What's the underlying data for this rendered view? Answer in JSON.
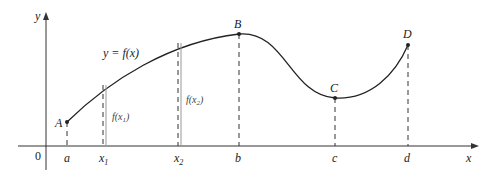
{
  "diagram": {
    "axes": {
      "x_label": "x",
      "y_label": "y",
      "origin_label": "0"
    },
    "curve_label": "y = f(x)",
    "points": [
      {
        "name": "A",
        "x_label": "a"
      },
      {
        "name": "B",
        "x_label": "b"
      },
      {
        "name": "C",
        "x_label": "c"
      },
      {
        "name": "D",
        "x_label": "d"
      }
    ],
    "x_marks": {
      "x1": "x",
      "x1_sub": "1",
      "x2": "x",
      "x2_sub": "2"
    },
    "heights": {
      "f_x1": {
        "pre": "f(x",
        "sub": "1",
        "post": ")"
      },
      "f_x2": {
        "pre": "f(x",
        "sub": "2",
        "post": ")"
      }
    }
  }
}
